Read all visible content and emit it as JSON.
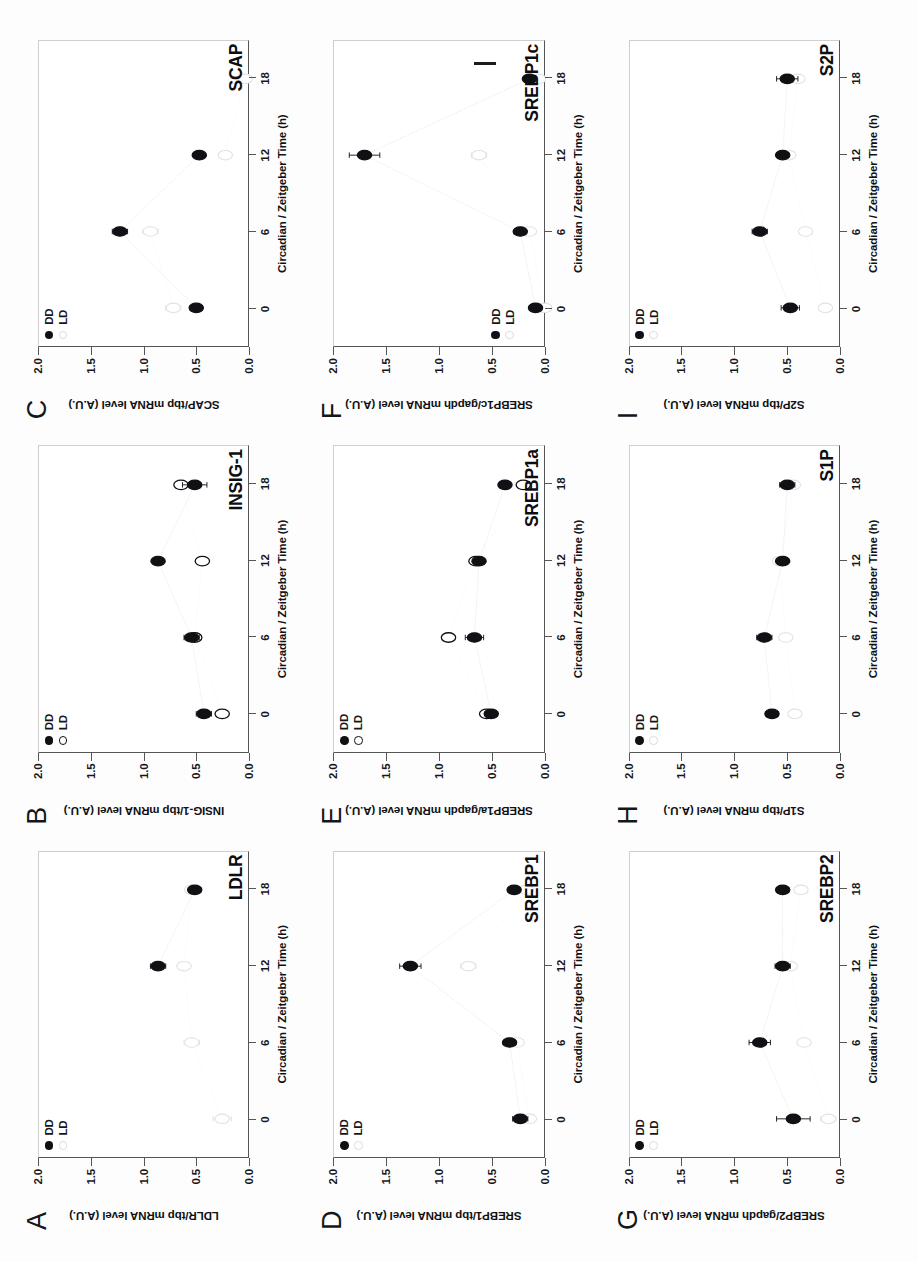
{
  "figure": {
    "x_axis_title": "Circadian / Zeitgeber Time (h)",
    "x_ticks": [
      "0",
      "6",
      "12",
      "18"
    ],
    "y_ticks": [
      "2.0",
      "1.5",
      "1.0",
      "0.5",
      "0.0"
    ],
    "legend": {
      "dd": "DD",
      "ld": "LD"
    },
    "colors": {
      "dd": "#101114",
      "ld": "#dcdcdc",
      "axis": "#555555",
      "frame": "#cfcfcf"
    }
  },
  "panels": [
    {
      "letter": "A",
      "gene": "LDLR",
      "ylabel": "LDLR/tbp mRNA level (A.U.)"
    },
    {
      "letter": "B",
      "gene": "INSIG-1",
      "ylabel": "INSIG-1/tbp mRNA level (A.U.)"
    },
    {
      "letter": "C",
      "gene": "SCAP",
      "ylabel": "SCAP/tbp mRNA level (A.U.)"
    },
    {
      "letter": "D",
      "gene": "SREBP1",
      "ylabel": "SREBP1/tbp mRNA level (A.U.)"
    },
    {
      "letter": "E",
      "gene": "SREBP1a",
      "ylabel": "SREBP1a/gapdh mRNA level (A.U.)"
    },
    {
      "letter": "F",
      "gene": "SREBP1c",
      "ylabel": "SREBP1c/gapdh mRNA level (A.U.)"
    },
    {
      "letter": "G",
      "gene": "SREBP2",
      "ylabel": "SREBP2/gapdh  mRNA  level (A.U.)"
    },
    {
      "letter": "H",
      "gene": "S1P",
      "ylabel": "S1P/tbp mRNA level (A.U.)"
    },
    {
      "letter": "I",
      "gene": "S2P",
      "ylabel": "S2P/tbp mRNA level (A.U.)"
    }
  ],
  "chart_data": [
    {
      "panel": "A",
      "type": "scatter",
      "title": "LDLR",
      "xlabel": "Circadian / Zeitgeber Time (h)",
      "ylabel": "LDLR/tbp mRNA level (A.U.)",
      "x": [
        0,
        6,
        12,
        18
      ],
      "xlim": [
        -3,
        21
      ],
      "ylim": [
        0.0,
        2.0
      ],
      "grid": false,
      "legend_position": "top-left-inside",
      "series": [
        {
          "name": "DD",
          "marker": "filled-circle",
          "values": [
            null,
            null,
            1.22,
            0.98
          ],
          "errors": [
            null,
            null,
            0.05,
            0.04
          ]
        },
        {
          "name": "LD",
          "marker": "open-circle-faint",
          "values": [
            0.8,
            1.0,
            1.05,
            1.0
          ],
          "errors": [
            0.06,
            0.05,
            0.03,
            0.03
          ]
        }
      ]
    },
    {
      "panel": "B",
      "type": "scatter",
      "title": "INSIG-1",
      "xlabel": "Circadian / Zeitgeber Time (h)",
      "ylabel": "INSIG-1/tbp mRNA level (A.U.)",
      "x": [
        0,
        6,
        12,
        18
      ],
      "xlim": [
        -3,
        21
      ],
      "ylim": [
        0.0,
        2.0
      ],
      "grid": false,
      "legend_position": "top-left-inside",
      "series": [
        {
          "name": "DD",
          "marker": "filled-circle",
          "values": [
            0.92,
            1.0,
            1.22,
            0.98
          ],
          "errors": [
            0.05,
            0.05,
            0.02,
            0.08
          ]
        },
        {
          "name": "LD",
          "marker": "open-circle",
          "values": [
            0.8,
            0.98,
            0.93,
            1.07
          ],
          "errors": [
            0.04,
            0.04,
            0.03,
            0.03
          ]
        }
      ]
    },
    {
      "panel": "C",
      "type": "scatter",
      "title": "SCAP",
      "xlabel": "Circadian / Zeitgeber Time (h)",
      "ylabel": "SCAP/tbp mRNA level (A.U.)",
      "x": [
        0,
        6,
        12,
        18
      ],
      "xlim": [
        -3,
        21
      ],
      "ylim": [
        0.0,
        2.0
      ],
      "grid": false,
      "legend_position": "top-left-inside",
      "series": [
        {
          "name": "DD",
          "marker": "filled-circle",
          "values": [
            0.97,
            1.47,
            0.95,
            null
          ],
          "errors": [
            0.04,
            0.05,
            0.03,
            null
          ]
        },
        {
          "name": "LD",
          "marker": "open-circle-faint",
          "values": [
            1.12,
            1.27,
            0.78,
            0.65
          ],
          "errors": [
            0.05,
            0.05,
            0.04,
            0.04
          ]
        }
      ]
    },
    {
      "panel": "D",
      "type": "scatter",
      "title": "SREBP1",
      "xlabel": "Circadian / Zeitgeber Time (h)",
      "ylabel": "SREBP1/tbp mRNA level (A.U.)",
      "x": [
        0,
        6,
        12,
        18
      ],
      "xlim": [
        -3,
        21
      ],
      "ylim": [
        0.0,
        2.0
      ],
      "grid": false,
      "legend_position": "top-left-inside",
      "series": [
        {
          "name": "DD",
          "marker": "filled-circle",
          "values": [
            0.78,
            0.85,
            1.5,
            0.82
          ],
          "errors": [
            0.05,
            0.04,
            0.07,
            0.04
          ]
        },
        {
          "name": "LD",
          "marker": "open-circle-faint",
          "values": [
            0.72,
            0.8,
            1.12,
            0.74
          ],
          "errors": [
            0.04,
            0.04,
            0.05,
            0.03
          ]
        }
      ]
    },
    {
      "panel": "E",
      "type": "scatter",
      "title": "SREBP1a",
      "xlabel": "Circadian / Zeitgeber Time (h)",
      "ylabel": "SREBP1a/gapdh mRNA level (A.U.)",
      "x": [
        0,
        6,
        12,
        18
      ],
      "xlim": [
        -3,
        21
      ],
      "ylim": [
        0.0,
        2.0
      ],
      "grid": false,
      "legend_position": "top-left-inside",
      "series": [
        {
          "name": "DD",
          "marker": "filled-circle",
          "values": [
            0.97,
            1.08,
            1.05,
            0.88
          ],
          "errors": [
            0.04,
            0.06,
            0.03,
            0.03
          ]
        },
        {
          "name": "LD",
          "marker": "open-circle",
          "values": [
            1.0,
            1.25,
            1.07,
            0.76
          ],
          "errors": [
            0.04,
            0.04,
            0.03,
            0.03
          ]
        }
      ]
    },
    {
      "panel": "F",
      "type": "scatter",
      "title": "SREBP1c",
      "xlabel": "Circadian / Zeitgeber Time (h)",
      "ylabel": "SREBP1c/gapdh mRNA level (A.U.)",
      "x": [
        0,
        6,
        12,
        18
      ],
      "xlim": [
        -3,
        21
      ],
      "ylim": [
        0.0,
        2.0
      ],
      "grid": false,
      "legend_position": "bottom-left-inside",
      "series": [
        {
          "name": "DD",
          "marker": "filled-circle",
          "values": [
            0.68,
            0.78,
            1.8,
            0.72
          ],
          "errors": [
            0.04,
            0.03,
            0.1,
            0.03
          ]
        },
        {
          "name": "LD",
          "marker": "open-circle-faint",
          "values": [
            0.62,
            0.72,
            1.05,
            0.66
          ],
          "errors": [
            0.04,
            0.03,
            0.05,
            0.03
          ]
        }
      ]
    },
    {
      "panel": "G",
      "type": "scatter",
      "title": "SREBP2",
      "xlabel": "Circadian / Zeitgeber Time (h)",
      "ylabel": "SREBP2/gapdh  mRNA  level (A.U.)",
      "x": [
        0,
        6,
        12,
        18
      ],
      "xlim": [
        -3,
        21
      ],
      "ylim": [
        0.0,
        2.0
      ],
      "grid": false,
      "legend_position": "top-left-inside",
      "series": [
        {
          "name": "DD",
          "marker": "filled-circle",
          "values": [
            0.93,
            1.15,
            1.0,
            1.0
          ],
          "errors": [
            0.11,
            0.07,
            0.05,
            0.04
          ]
        },
        {
          "name": "LD",
          "marker": "open-circle-faint",
          "values": [
            0.7,
            0.86,
            0.95,
            0.88
          ],
          "errors": [
            0.05,
            0.04,
            0.04,
            0.04
          ]
        }
      ]
    },
    {
      "panel": "H",
      "type": "scatter",
      "title": "S1P",
      "xlabel": "Circadian / Zeitgeber Time (h)",
      "ylabel": "S1P/tbp mRNA level (A.U.)",
      "x": [
        0,
        6,
        12,
        18
      ],
      "xlim": [
        -3,
        21
      ],
      "ylim": [
        0.0,
        2.0
      ],
      "grid": false,
      "legend_position": "top-left-inside",
      "series": [
        {
          "name": "DD",
          "marker": "filled-circle",
          "values": [
            1.07,
            1.12,
            1.0,
            0.97
          ],
          "errors": [
            0.04,
            0.05,
            0.03,
            0.05
          ]
        },
        {
          "name": "LD",
          "marker": "open-circle-faint",
          "values": [
            0.92,
            0.98,
            1.02,
            0.93
          ],
          "errors": [
            0.04,
            0.04,
            0.03,
            0.03
          ]
        }
      ]
    },
    {
      "panel": "I",
      "type": "scatter",
      "title": "S2P",
      "xlabel": "Circadian / Zeitgeber Time (h)",
      "ylabel": "S2P/tbp mRNA level (A.U.)",
      "x": [
        0,
        6,
        12,
        18
      ],
      "xlim": [
        -3,
        21
      ],
      "ylim": [
        0.0,
        2.0
      ],
      "grid": false,
      "legend_position": "top-left-inside",
      "series": [
        {
          "name": "DD",
          "marker": "filled-circle",
          "values": [
            0.95,
            1.15,
            1.0,
            0.97
          ],
          "errors": [
            0.06,
            0.05,
            0.04,
            0.07
          ]
        },
        {
          "name": "LD",
          "marker": "open-circle-faint",
          "values": [
            0.72,
            0.85,
            0.96,
            0.9
          ],
          "errors": [
            0.04,
            0.04,
            0.03,
            0.03
          ]
        }
      ]
    }
  ]
}
